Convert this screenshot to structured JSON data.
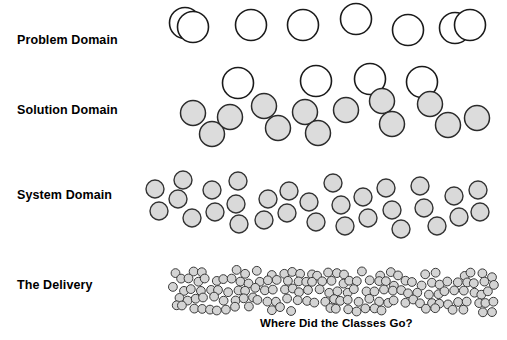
{
  "diagram": {
    "title_caption": "Where Did the Classes Go?",
    "background_color": "#ffffff",
    "rows": [
      {
        "label": "Problem Domain",
        "label_x": 17,
        "label_y": 42,
        "node_kind": "hollow-circle",
        "fill": "#ffffff",
        "stroke": "#1a1a1a",
        "stroke_width": 1.6,
        "radius": 15.5,
        "count": 12,
        "nodes": [
          [
            185,
            23
          ],
          [
            238,
            83
          ],
          [
            251,
            25
          ],
          [
            303,
            25
          ],
          [
            316,
            81
          ],
          [
            356,
            19
          ],
          [
            370,
            79
          ],
          [
            408,
            30
          ],
          [
            422,
            82
          ],
          [
            455,
            28
          ],
          [
            470,
            25
          ],
          [
            193,
            27
          ]
        ]
      },
      {
        "label": "Solution Domain",
        "label_x": 17,
        "label_y": 112,
        "node_kind": "filled-circle",
        "fill": "#dcdcdc",
        "stroke": "#2b2b2b",
        "stroke_width": 1.5,
        "radius": 12.5,
        "count": 12,
        "nodes": [
          [
            193,
            113
          ],
          [
            212,
            134
          ],
          [
            230,
            117
          ],
          [
            264,
            106
          ],
          [
            278,
            128
          ],
          [
            305,
            112
          ],
          [
            318,
            133
          ],
          [
            346,
            110
          ],
          [
            382,
            101
          ],
          [
            392,
            124
          ],
          [
            430,
            104
          ],
          [
            448,
            125
          ],
          [
            477,
            118
          ]
        ]
      },
      {
        "label": "System Domain",
        "label_x": 17,
        "label_y": 197,
        "node_kind": "filled-circle",
        "fill": "#d9d9d9",
        "stroke": "#333333",
        "stroke_width": 1.4,
        "radius": 9,
        "count": 31,
        "nodes": [
          [
            155,
            189
          ],
          [
            159,
            211
          ],
          [
            183,
            180
          ],
          [
            178,
            199
          ],
          [
            192,
            218
          ],
          [
            212,
            190
          ],
          [
            215,
            212
          ],
          [
            238,
            181
          ],
          [
            236,
            204
          ],
          [
            239,
            224
          ],
          [
            268,
            199
          ],
          [
            264,
            220
          ],
          [
            289,
            191
          ],
          [
            287,
            213
          ],
          [
            309,
            202
          ],
          [
            316,
            222
          ],
          [
            333,
            183
          ],
          [
            341,
            205
          ],
          [
            345,
            226
          ],
          [
            363,
            197
          ],
          [
            368,
            218
          ],
          [
            386,
            188
          ],
          [
            392,
            210
          ],
          [
            401,
            229
          ],
          [
            420,
            186
          ],
          [
            424,
            208
          ],
          [
            437,
            226
          ],
          [
            454,
            196
          ],
          [
            459,
            217
          ],
          [
            478,
            190
          ],
          [
            480,
            212
          ]
        ]
      },
      {
        "label": "The Delivery",
        "label_x": 17,
        "label_y": 287,
        "node_kind": "filled-circle",
        "fill": "#d4d4d4",
        "stroke": "#3a3a3a",
        "stroke_width": 1,
        "radius": 4.4,
        "count": 200,
        "band": {
          "x_start": 170,
          "x_end": 495,
          "y_top": 267,
          "y_bottom": 312
        }
      }
    ],
    "caption": {
      "text": "Where Did the Classes Go?",
      "x": 260,
      "y": 318
    }
  }
}
